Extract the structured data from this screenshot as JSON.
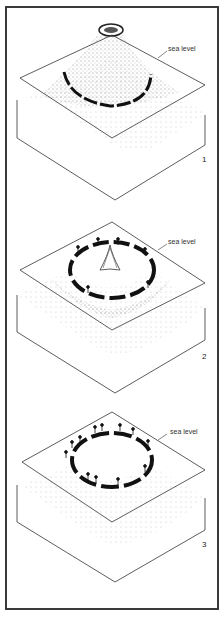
{
  "figure": {
    "stages": [
      {
        "number": "1",
        "sea_label": "sea level",
        "description": "Volcanic island with fringing reef at sea level"
      },
      {
        "number": "2",
        "sea_label": "sea level",
        "description": "Subsiding volcano with barrier reef and palm-covered islets"
      },
      {
        "number": "3",
        "sea_label": "sea level",
        "description": "Atoll: ring of reef islands with palms surrounding lagoon"
      }
    ]
  },
  "colors": {
    "ink": "#1a1a1a",
    "frame": "#3a3a3a",
    "background": "#ffffff",
    "stipple": "#555555"
  }
}
